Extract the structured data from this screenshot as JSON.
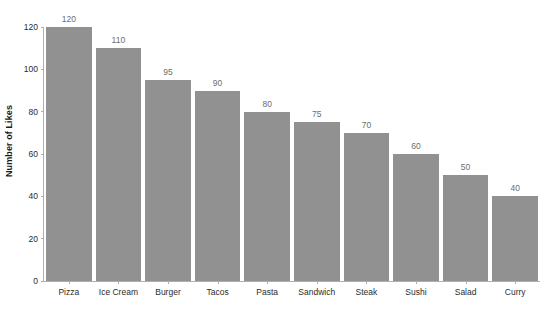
{
  "chart_data": {
    "type": "bar",
    "title": "",
    "subtitle": "",
    "xlabel": "",
    "ylabel": "Number of Likes",
    "categories": [
      "Pizza",
      "Ice Cream",
      "Burger",
      "Tacos",
      "Pasta",
      "Sandwich",
      "Steak",
      "Sushi",
      "Salad",
      "Curry"
    ],
    "values": [
      120,
      110,
      95,
      90,
      80,
      75,
      70,
      60,
      50,
      40
    ],
    "data_labels": [
      "120",
      "110",
      "95",
      "90",
      "80",
      "75",
      "70",
      "60",
      "50",
      "40"
    ],
    "ylim": [
      0,
      120
    ],
    "y_ticks": [
      0,
      20,
      40,
      60,
      80,
      100,
      120
    ],
    "y_tick_labels": [
      "0",
      "20",
      "40",
      "60",
      "80",
      "100",
      "120"
    ],
    "grid": false,
    "legend": null,
    "legend_position": "none",
    "bar_color": "#919191",
    "data_label_color": "#6d6d6d",
    "axis_color": "#b0b0b0",
    "tick_label_color": "#2b2b2b",
    "background_color": "#ffffff"
  }
}
